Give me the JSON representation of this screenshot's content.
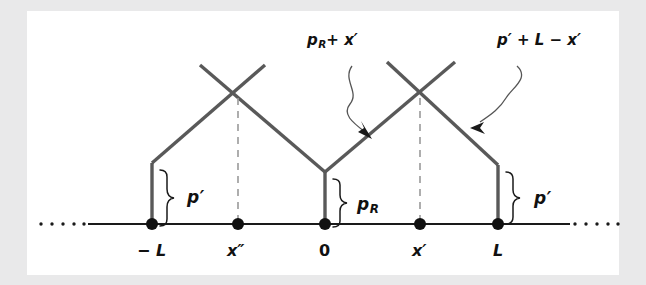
{
  "figure": {
    "kind": "line-diagram",
    "background_color": "#e9e9ea",
    "panel_color": "#ffffff",
    "stroke_color": "#555555",
    "axis_color": "#1a1a1a"
  },
  "annotations": {
    "left_path_label": {
      "text_plain": "p_R + x'",
      "base": "p",
      "subscript": "R",
      "rest": "+ x′"
    },
    "right_path_label": {
      "text_plain": "p' + L - x'",
      "text": "p′ + L − x′"
    }
  },
  "braces": [
    {
      "id": "brace-left",
      "label_base": "p",
      "label_rest": "′",
      "label_sub": ""
    },
    {
      "id": "brace-center",
      "label_base": "p",
      "label_rest": "",
      "label_sub": "R"
    },
    {
      "id": "brace-right",
      "label_base": "p",
      "label_rest": "′",
      "label_sub": ""
    }
  ],
  "axis": {
    "ticks": [
      {
        "id": "tick-minus-L",
        "label": "− L",
        "x": 152
      },
      {
        "id": "tick-x2",
        "label": "x″",
        "x": 238
      },
      {
        "id": "tick-zero",
        "label": "0",
        "x": 325
      },
      {
        "id": "tick-x1",
        "label": "x′",
        "x": 420
      },
      {
        "id": "tick-L",
        "label": "L",
        "x": 498
      }
    ],
    "left_ellipsis": "·····",
    "right_ellipsis": "·····"
  }
}
